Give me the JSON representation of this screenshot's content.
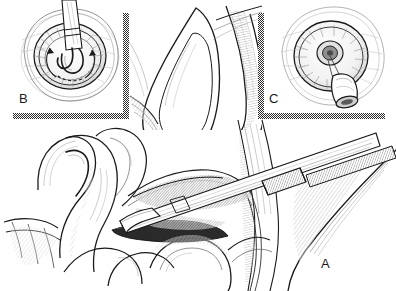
{
  "figure": {
    "kind": "medical-line-illustration",
    "background_color": "#ffffff",
    "ink_color": "#1a1a1a",
    "divider_color": "#3a3a3a",
    "width": 396,
    "height": 291
  },
  "panels": [
    {
      "id": "a",
      "label": "A",
      "label_x": 321,
      "label_y": 257,
      "caption": "Sagittal view: instrument shaft entering tissue plane alongside bowel loops",
      "region": "main-lower"
    },
    {
      "id": "b",
      "label": "B",
      "label_x": 19,
      "label_y": 92,
      "caption": "Inset: en-face view of orifice with instrument inserted, rotation arrows",
      "region": "inset-top-left"
    },
    {
      "id": "c",
      "label": "C",
      "label_x": 269,
      "label_y": 92,
      "caption": "Inset: en-face view of orifice with conical device seated",
      "region": "inset-top-right"
    }
  ],
  "dividers": {
    "left_vertical": {
      "x": 126,
      "y_top": 13,
      "y_bottom": 119,
      "thickness": 6
    },
    "right_vertical": {
      "x": 261,
      "y_top": 13,
      "y_bottom": 119,
      "thickness": 6
    },
    "left_horizontal": {
      "x_start": 13,
      "x_end": 129,
      "y": 115,
      "thickness": 6
    },
    "right_horizontal": {
      "x_start": 258,
      "x_end": 385,
      "y": 115,
      "thickness": 6
    }
  },
  "annotations": {
    "rotation_arrows_panel_b": 2,
    "instrument_panel_a": "trocar-with-blade-tip",
    "instrument_panel_b": "probe-tip",
    "device_panel_c": "conical-cannula"
  }
}
